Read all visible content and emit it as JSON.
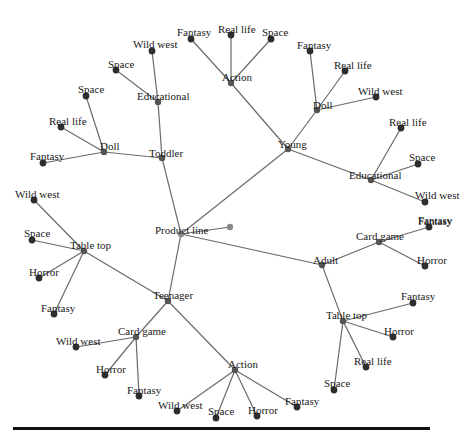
{
  "diagram": {
    "root": {
      "id": "product_line",
      "label": "Product line",
      "x": 181,
      "y": 234,
      "lx": 155,
      "ly": 225
    },
    "nodes": [
      {
        "id": "pl_extra",
        "label": "",
        "x": 230,
        "y": 227,
        "parent": "product_line",
        "kind": "inner"
      },
      {
        "id": "young",
        "label": "Young",
        "x": 288,
        "y": 149,
        "parent": "product_line",
        "kind": "inner",
        "lx": 278,
        "ly": 139
      },
      {
        "id": "y_action",
        "label": "Action",
        "x": 231,
        "y": 83,
        "parent": "young",
        "kind": "inner",
        "lx": 222,
        "ly": 72
      },
      {
        "id": "y_action_fantasy",
        "label": "Fantasy",
        "x": 191,
        "y": 39,
        "parent": "y_action",
        "kind": "leaf",
        "lx": 177,
        "ly": 27
      },
      {
        "id": "y_action_reallife",
        "label": "Real life",
        "x": 231,
        "y": 35,
        "parent": "y_action",
        "kind": "leaf",
        "lx": 218,
        "ly": 24
      },
      {
        "id": "y_action_space",
        "label": "Space",
        "x": 271,
        "y": 39,
        "parent": "y_action",
        "kind": "leaf",
        "lx": 262,
        "ly": 27
      },
      {
        "id": "y_doll",
        "label": "Doll",
        "x": 317,
        "y": 110,
        "parent": "young",
        "kind": "inner",
        "lx": 313,
        "ly": 100
      },
      {
        "id": "y_doll_fantasy",
        "label": "Fantasy",
        "x": 310,
        "y": 51,
        "parent": "y_doll",
        "kind": "leaf",
        "lx": 297,
        "ly": 40
      },
      {
        "id": "y_doll_reallife",
        "label": "Real life",
        "x": 345,
        "y": 71,
        "parent": "y_doll",
        "kind": "leaf",
        "lx": 334,
        "ly": 60
      },
      {
        "id": "y_doll_wildwest",
        "label": "Wild west",
        "x": 376,
        "y": 97,
        "parent": "y_doll",
        "kind": "leaf",
        "lx": 358,
        "ly": 86
      },
      {
        "id": "y_edu",
        "label": "Educational",
        "x": 371,
        "y": 180,
        "parent": "young",
        "kind": "inner",
        "lx": 349,
        "ly": 170
      },
      {
        "id": "y_edu_reallife",
        "label": "Real life",
        "x": 401,
        "y": 128,
        "parent": "y_edu",
        "kind": "leaf",
        "lx": 389,
        "ly": 117
      },
      {
        "id": "y_edu_space",
        "label": "Space",
        "x": 418,
        "y": 164,
        "parent": "y_edu",
        "kind": "leaf",
        "lx": 409,
        "ly": 152
      },
      {
        "id": "y_edu_wildwest",
        "label": "Wild west",
        "x": 425,
        "y": 202,
        "parent": "y_edu",
        "kind": "leaf",
        "lx": 415,
        "ly": 190
      },
      {
        "id": "y_edu_fantasy_label",
        "label": "Fantasy",
        "x": null,
        "y": null,
        "parent": null,
        "kind": "label",
        "lx": 418,
        "ly": 216
      },
      {
        "id": "toddler",
        "label": "Toddler",
        "x": 162,
        "y": 158,
        "parent": "product_line",
        "kind": "inner",
        "lx": 149,
        "ly": 148
      },
      {
        "id": "t_edu",
        "label": "Educational",
        "x": 158,
        "y": 102,
        "parent": "toddler",
        "kind": "inner",
        "lx": 137,
        "ly": 91
      },
      {
        "id": "t_edu_wildwest",
        "label": "Wild west",
        "x": 152,
        "y": 51,
        "parent": "t_edu",
        "kind": "leaf",
        "lx": 133,
        "ly": 39
      },
      {
        "id": "t_edu_space",
        "label": "Space",
        "x": 116,
        "y": 70,
        "parent": "t_edu",
        "kind": "leaf",
        "lx": 108,
        "ly": 59
      },
      {
        "id": "t_doll",
        "label": "Doll",
        "x": 104,
        "y": 152,
        "parent": "toddler",
        "kind": "inner",
        "lx": 100,
        "ly": 141
      },
      {
        "id": "t_doll_space",
        "label": "Space",
        "x": 86,
        "y": 96,
        "parent": "t_doll",
        "kind": "leaf",
        "lx": 78,
        "ly": 84
      },
      {
        "id": "t_doll_reallife",
        "label": "Real life",
        "x": 61,
        "y": 127,
        "parent": "t_doll",
        "kind": "leaf",
        "lx": 49,
        "ly": 116
      },
      {
        "id": "t_doll_fantasy",
        "label": "Fantasy",
        "x": 43,
        "y": 163,
        "parent": "t_doll",
        "kind": "leaf",
        "lx": 30,
        "ly": 151
      },
      {
        "id": "teenager",
        "label": "Teenager",
        "x": 168,
        "y": 301,
        "parent": "product_line",
        "kind": "inner",
        "lx": 153,
        "ly": 290
      },
      {
        "id": "te_tabletop",
        "label": "Table top",
        "x": 84,
        "y": 251,
        "parent": "teenager",
        "kind": "inner",
        "lx": 70,
        "ly": 240
      },
      {
        "id": "te_tt_wildwest",
        "label": "Wild west",
        "x": 34,
        "y": 200,
        "parent": "te_tabletop",
        "kind": "leaf",
        "lx": 15,
        "ly": 189
      },
      {
        "id": "te_tt_space",
        "label": "Space",
        "x": 32,
        "y": 240,
        "parent": "te_tabletop",
        "kind": "leaf",
        "lx": 24,
        "ly": 228
      },
      {
        "id": "te_tt_horror",
        "label": "Horror",
        "x": 39,
        "y": 278,
        "parent": "te_tabletop",
        "kind": "leaf",
        "lx": 29,
        "ly": 267
      },
      {
        "id": "te_tt_fantasy",
        "label": "Fantasy",
        "x": 54,
        "y": 314,
        "parent": "te_tabletop",
        "kind": "leaf",
        "lx": 41,
        "ly": 303
      },
      {
        "id": "te_cardgame",
        "label": "Card game",
        "x": 136,
        "y": 337,
        "parent": "teenager",
        "kind": "inner",
        "lx": 118,
        "ly": 326
      },
      {
        "id": "te_cg_wildwest",
        "label": "Wild west",
        "x": 76,
        "y": 347,
        "parent": "te_cardgame",
        "kind": "leaf",
        "lx": 56,
        "ly": 336
      },
      {
        "id": "te_cg_horror",
        "label": "Horror",
        "x": 105,
        "y": 375,
        "parent": "te_cardgame",
        "kind": "leaf",
        "lx": 96,
        "ly": 364
      },
      {
        "id": "te_cg_fantasy",
        "label": "Fantasy",
        "x": 139,
        "y": 396,
        "parent": "te_cardgame",
        "kind": "leaf",
        "lx": 127,
        "ly": 385
      },
      {
        "id": "te_action",
        "label": "Action",
        "x": 235,
        "y": 370,
        "parent": "teenager",
        "kind": "inner",
        "lx": 228,
        "ly": 359
      },
      {
        "id": "te_act_wildwest",
        "label": "Wild west",
        "x": 177,
        "y": 411,
        "parent": "te_action",
        "kind": "leaf",
        "lx": 158,
        "ly": 400
      },
      {
        "id": "te_act_space",
        "label": "Space",
        "x": 216,
        "y": 418,
        "parent": "te_action",
        "kind": "leaf",
        "lx": 208,
        "ly": 406
      },
      {
        "id": "te_act_horror",
        "label": "Horror",
        "x": 257,
        "y": 416,
        "parent": "te_action",
        "kind": "leaf",
        "lx": 248,
        "ly": 405
      },
      {
        "id": "te_act_fantasy",
        "label": "Fantasy",
        "x": 297,
        "y": 407,
        "parent": "te_action",
        "kind": "leaf",
        "lx": 285,
        "ly": 396
      },
      {
        "id": "adult",
        "label": "Adult",
        "x": 322,
        "y": 265,
        "parent": "product_line",
        "kind": "inner",
        "lx": 313,
        "ly": 255
      },
      {
        "id": "a_cardgame",
        "label": "Card game",
        "x": 379,
        "y": 242,
        "parent": "adult",
        "kind": "inner",
        "lx": 356,
        "ly": 231
      },
      {
        "id": "a_cg_fantasy",
        "label": "Fantasy",
        "x": 429,
        "y": 227,
        "parent": "a_cardgame",
        "kind": "leaf",
        "lx": 418,
        "ly": 215
      },
      {
        "id": "a_cg_horror",
        "label": "Horror",
        "x": 425,
        "y": 266,
        "parent": "a_cardgame",
        "kind": "leaf",
        "lx": 417,
        "ly": 255
      },
      {
        "id": "a_tabletop",
        "label": "Table top",
        "x": 343,
        "y": 321,
        "parent": "adult",
        "kind": "inner",
        "lx": 326,
        "ly": 310
      },
      {
        "id": "a_tt_fantasy",
        "label": "Fantasy",
        "x": 413,
        "y": 303,
        "parent": "a_tabletop",
        "kind": "leaf",
        "lx": 401,
        "ly": 291
      },
      {
        "id": "a_tt_horror",
        "label": "Horror",
        "x": 393,
        "y": 337,
        "parent": "a_tabletop",
        "kind": "leaf",
        "lx": 384,
        "ly": 326
      },
      {
        "id": "a_tt_reallife",
        "label": "Real life",
        "x": 366,
        "y": 367,
        "parent": "a_tabletop",
        "kind": "leaf",
        "lx": 354,
        "ly": 356
      },
      {
        "id": "a_tt_space",
        "label": "Space",
        "x": 334,
        "y": 390,
        "parent": "a_tabletop",
        "kind": "leaf",
        "lx": 324,
        "ly": 378
      }
    ]
  }
}
